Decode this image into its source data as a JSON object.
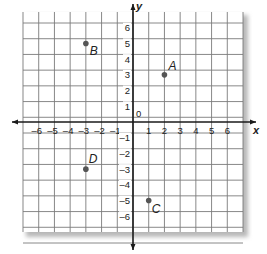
{
  "diagram": {
    "type": "coordinate-plane",
    "x_axis": {
      "label": "x",
      "min": -7,
      "max": 7,
      "tick_labels": [
        "-6",
        "-5",
        "-4",
        "-3",
        "-2",
        "-1",
        "1",
        "2",
        "3",
        "4",
        "5",
        "6"
      ]
    },
    "y_axis": {
      "label": "y",
      "min": -7,
      "max": 7,
      "tick_labels": [
        "6",
        "5",
        "4",
        "3",
        "2",
        "1",
        "-1",
        "-2",
        "-3",
        "-4",
        "-5",
        "-6"
      ]
    },
    "origin_label": "0",
    "points": [
      {
        "name": "A",
        "x": 2,
        "y": 3
      },
      {
        "name": "B",
        "x": -3,
        "y": 5
      },
      {
        "name": "C",
        "x": 1,
        "y": -5
      },
      {
        "name": "D",
        "x": -3,
        "y": -3
      }
    ],
    "colors": {
      "grid": "#7a7a7a",
      "axis": "#1a1a1a",
      "point": "#555555",
      "shadow": "#bdbdbd"
    }
  }
}
